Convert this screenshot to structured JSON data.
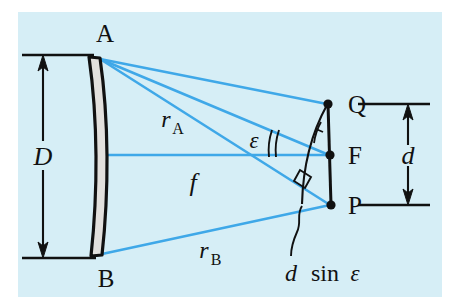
{
  "figure": {
    "kind": "optics-ray-diagram",
    "background_color": "#d6eef6",
    "page_color": "#ffffff",
    "ray_color": "#3fa8e8",
    "ink_color": "#111111",
    "optic_fill": "#e2e0dd"
  },
  "labels": {
    "aperture_top": "A",
    "aperture_bottom": "B",
    "aperture_diameter": "D",
    "focal_length": "f",
    "ray_top": "r",
    "ray_top_sub": "A",
    "ray_bottom": "r",
    "ray_bottom_sub": "B",
    "angle": "ε",
    "point_q": "Q",
    "point_f": "F",
    "point_p": "P",
    "separation": "d",
    "path_difference_d": "d",
    "path_difference_sin": "sin",
    "path_difference_eps": "ε"
  },
  "geometry": {
    "aperture_top_point": [
      98,
      58
    ],
    "aperture_bottom_point": [
      100,
      255
    ],
    "focus_point_q": [
      328,
      104
    ],
    "focus_point_f": [
      330,
      155
    ],
    "focus_point_p": [
      331,
      205
    ],
    "axis_y": 155,
    "dimension_D_x": 43,
    "dimension_d_x": 408
  },
  "annotations": {
    "right_angle_marker": "right-angle",
    "angle_tick_single": "one-tick",
    "angle_tick_double": "two-ticks",
    "leader_line": "curved-leader-to-arc"
  }
}
